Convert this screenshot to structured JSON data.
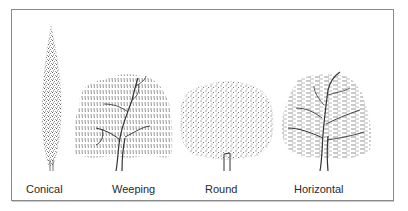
{
  "figure": {
    "trees": [
      {
        "id": "conical",
        "label": "Conical"
      },
      {
        "id": "weeping",
        "label": "Weeping"
      },
      {
        "id": "round",
        "label": "Round"
      },
      {
        "id": "horizontal",
        "label": "Horizontal"
      }
    ]
  },
  "colors": {
    "ink": "#2a2a2a",
    "border": "#8a8a8a",
    "background": "#ffffff"
  }
}
